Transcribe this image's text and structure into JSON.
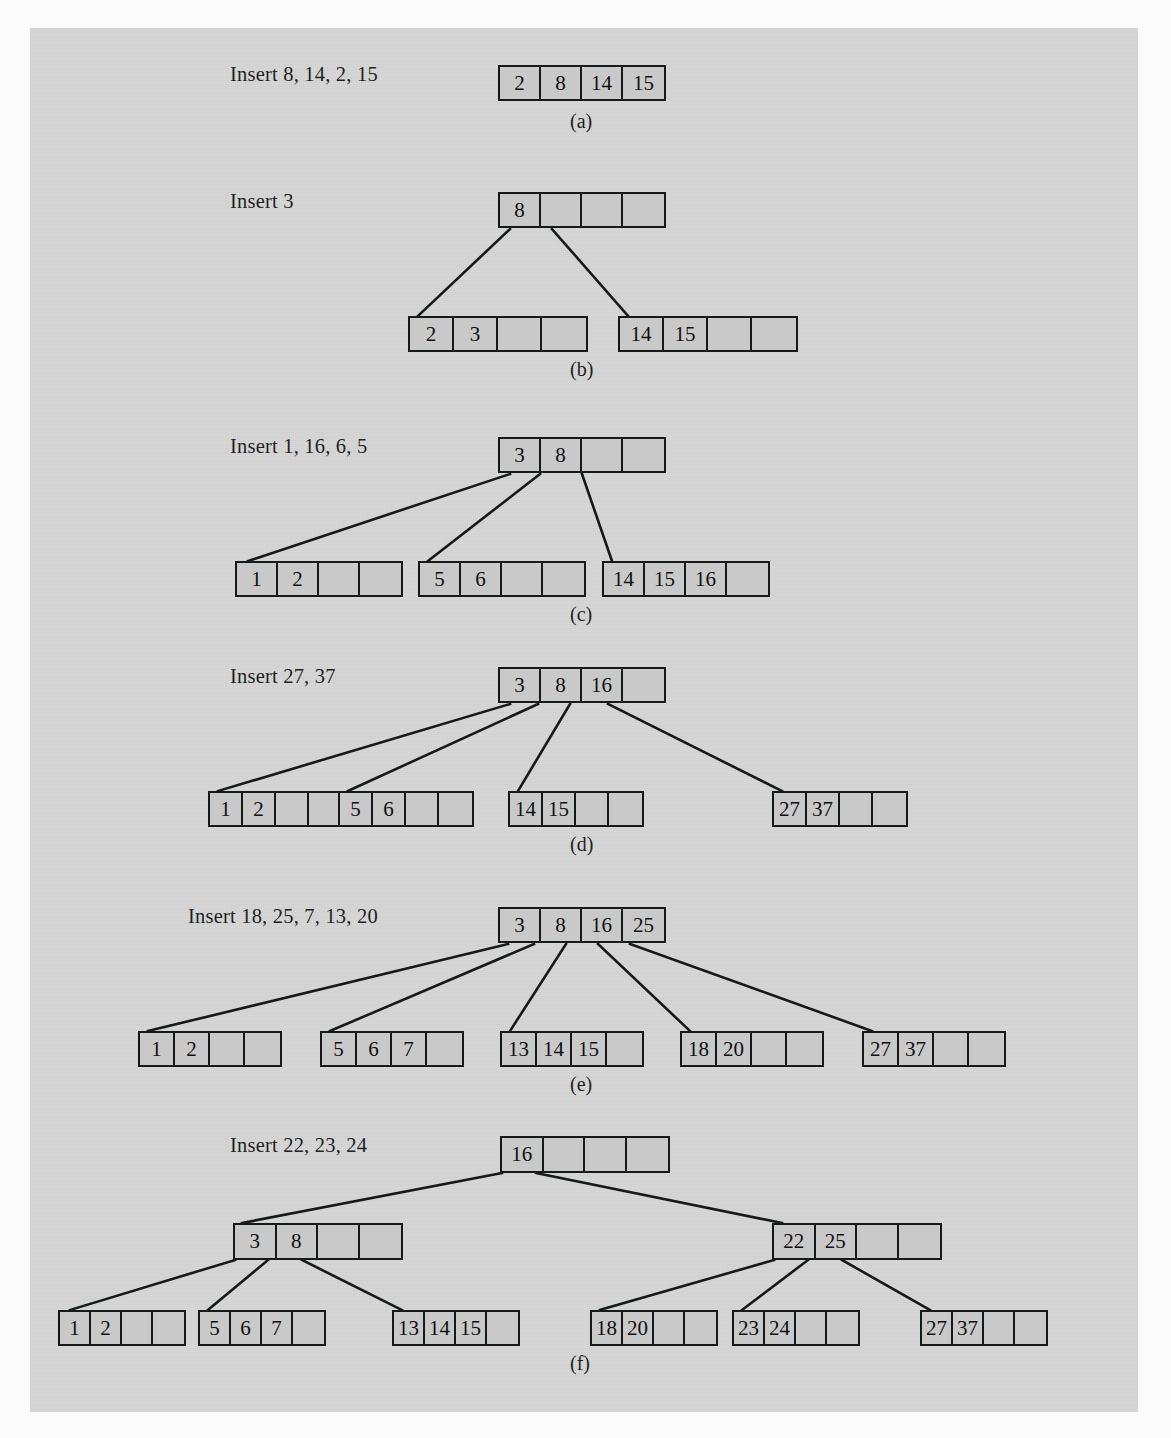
{
  "figure": {
    "colors": {
      "page_background": "#fbfbfb",
      "panel_background": "#d6d6d6",
      "node_fill": "#c9c9c9",
      "ink": "#16191a"
    },
    "node_order": 4,
    "panels": [
      {
        "id": "a",
        "letter": "(a)",
        "insert_label": "Insert 8, 14, 2, 15",
        "levels": [
          {
            "nodes": [
              {
                "keys": [
                  "2",
                  "8",
                  "14",
                  "15"
                ]
              }
            ]
          }
        ]
      },
      {
        "id": "b",
        "letter": "(b)",
        "insert_label": "Insert 3",
        "levels": [
          {
            "nodes": [
              {
                "keys": [
                  "8",
                  "",
                  "",
                  ""
                ]
              }
            ]
          },
          {
            "nodes": [
              {
                "keys": [
                  "2",
                  "3",
                  "",
                  ""
                ]
              },
              {
                "keys": [
                  "14",
                  "15",
                  "",
                  ""
                ]
              }
            ]
          }
        ]
      },
      {
        "id": "c",
        "letter": "(c)",
        "insert_label": "Insert 1, 16, 6, 5",
        "levels": [
          {
            "nodes": [
              {
                "keys": [
                  "3",
                  "8",
                  "",
                  ""
                ]
              }
            ]
          },
          {
            "nodes": [
              {
                "keys": [
                  "1",
                  "2",
                  "",
                  ""
                ]
              },
              {
                "keys": [
                  "5",
                  "6",
                  "",
                  ""
                ]
              },
              {
                "keys": [
                  "14",
                  "15",
                  "16",
                  ""
                ]
              }
            ]
          }
        ]
      },
      {
        "id": "d",
        "letter": "(d)",
        "insert_label": "Insert 27, 37",
        "levels": [
          {
            "nodes": [
              {
                "keys": [
                  "3",
                  "8",
                  "16",
                  ""
                ]
              }
            ]
          },
          {
            "nodes": [
              {
                "keys": [
                  "1",
                  "2",
                  "",
                  ""
                ]
              },
              {
                "keys": [
                  "5",
                  "6",
                  "",
                  ""
                ]
              },
              {
                "keys": [
                  "14",
                  "15",
                  "",
                  ""
                ]
              },
              {
                "keys": [
                  "27",
                  "37",
                  "",
                  ""
                ]
              }
            ]
          }
        ]
      },
      {
        "id": "e",
        "letter": "(e)",
        "insert_label": "Insert 18, 25, 7, 13, 20",
        "levels": [
          {
            "nodes": [
              {
                "keys": [
                  "3",
                  "8",
                  "16",
                  "25"
                ]
              }
            ]
          },
          {
            "nodes": [
              {
                "keys": [
                  "1",
                  "2",
                  "",
                  ""
                ]
              },
              {
                "keys": [
                  "5",
                  "6",
                  "7",
                  ""
                ]
              },
              {
                "keys": [
                  "13",
                  "14",
                  "15",
                  ""
                ]
              },
              {
                "keys": [
                  "18",
                  "20",
                  "",
                  ""
                ]
              },
              {
                "keys": [
                  "27",
                  "37",
                  "",
                  ""
                ]
              }
            ]
          }
        ]
      },
      {
        "id": "f",
        "letter": "(f)",
        "insert_label": "Insert 22, 23, 24",
        "levels": [
          {
            "nodes": [
              {
                "keys": [
                  "16",
                  "",
                  "",
                  ""
                ]
              }
            ]
          },
          {
            "nodes": [
              {
                "keys": [
                  "3",
                  "8",
                  "",
                  ""
                ]
              },
              {
                "keys": [
                  "22",
                  "25",
                  "",
                  ""
                ]
              }
            ]
          },
          {
            "nodes": [
              {
                "keys": [
                  "1",
                  "2",
                  "",
                  ""
                ]
              },
              {
                "keys": [
                  "5",
                  "6",
                  "7",
                  ""
                ]
              },
              {
                "keys": [
                  "13",
                  "14",
                  "15",
                  ""
                ]
              },
              {
                "keys": [
                  "18",
                  "20",
                  "",
                  ""
                ]
              },
              {
                "keys": [
                  "23",
                  "24",
                  "",
                  ""
                ]
              },
              {
                "keys": [
                  "27",
                  "37",
                  "",
                  ""
                ]
              }
            ]
          }
        ]
      }
    ]
  }
}
